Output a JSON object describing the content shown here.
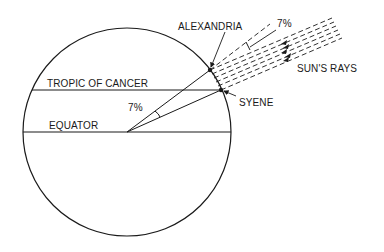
{
  "diagram": {
    "labels": {
      "alexandria": "ALEXANDRIA",
      "syene": "SYENE",
      "tropic": "TROPIC OF CANCER",
      "equator": "EQUATOR",
      "suns_rays": "SUN'S RAYS",
      "angle_top": "7%",
      "angle_center": "7%"
    },
    "colors": {
      "stroke": "#1a1a1a",
      "background": "#ffffff"
    }
  }
}
